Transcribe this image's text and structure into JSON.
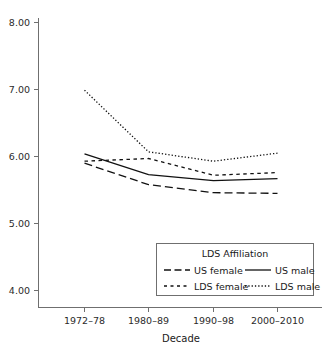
{
  "chart_data": {
    "type": "line",
    "title": "",
    "xlabel": "Decade",
    "ylabel": "",
    "categories": [
      "1972–78",
      "1980–89",
      "1990–98",
      "2000–2010"
    ],
    "ylim": [
      4.0,
      8.0
    ],
    "ytick_labels": [
      "4.00",
      "5.00",
      "6.00",
      "7.00",
      "8.00"
    ],
    "ytick_values": [
      4.0,
      5.0,
      6.0,
      7.0,
      8.0
    ],
    "grid": false,
    "legend_position": "inside-lower-right",
    "legend_title": "LDS Affiliation",
    "series": [
      {
        "name": "US female",
        "dash": "long-dash",
        "values": [
          5.9,
          5.58,
          5.46,
          5.45
        ]
      },
      {
        "name": "US male",
        "dash": "solid",
        "values": [
          6.04,
          5.73,
          5.64,
          5.67
        ]
      },
      {
        "name": "LDS female",
        "dash": "short-dash",
        "values": [
          5.93,
          5.97,
          5.72,
          5.76
        ]
      },
      {
        "name": "LDS male",
        "dash": "dotted",
        "values": [
          6.99,
          6.07,
          5.93,
          6.05
        ]
      }
    ],
    "colors": {
      "line": "#111111",
      "axis": "#6f6f6f",
      "text": "#1a1a1a",
      "background": "#ffffff"
    }
  },
  "axis": {
    "y_labels": [
      "8.00",
      "7.00",
      "6.00",
      "5.00",
      "4.00"
    ],
    "x_labels": [
      "1972–78",
      "1980–89",
      "1990–98",
      "2000–2010"
    ],
    "x_title": "Decade"
  },
  "legend": {
    "title": "LDS Affiliation",
    "entries": [
      {
        "label": "US female",
        "style": "long-dash"
      },
      {
        "label": "US male",
        "style": "solid"
      },
      {
        "label": "LDS female",
        "style": "short-dash"
      },
      {
        "label": "LDS male",
        "style": "dotted"
      }
    ]
  }
}
